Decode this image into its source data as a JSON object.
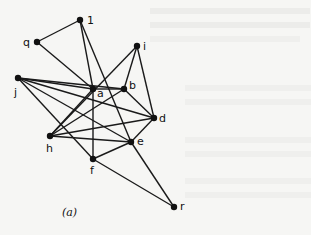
{
  "figure": {
    "caption": "(a)",
    "nodes": [
      {
        "id": "l",
        "label": "1",
        "x": 80,
        "y": 20,
        "lx": 87,
        "ly": 24
      },
      {
        "id": "q",
        "label": "q",
        "x": 37,
        "y": 42,
        "lx": 23,
        "ly": 46
      },
      {
        "id": "i",
        "label": "i",
        "x": 137,
        "y": 46,
        "lx": 143,
        "ly": 50
      },
      {
        "id": "j",
        "label": "j",
        "x": 18,
        "y": 78,
        "lx": 14,
        "ly": 96
      },
      {
        "id": "a",
        "label": "a",
        "x": 93,
        "y": 89,
        "lx": 97,
        "ly": 97
      },
      {
        "id": "b",
        "label": "b",
        "x": 124,
        "y": 89,
        "lx": 129,
        "ly": 89
      },
      {
        "id": "d",
        "label": "d",
        "x": 154,
        "y": 118,
        "lx": 159,
        "ly": 122
      },
      {
        "id": "h",
        "label": "h",
        "x": 50,
        "y": 136,
        "lx": 46,
        "ly": 152
      },
      {
        "id": "e",
        "label": "e",
        "x": 131,
        "y": 142,
        "lx": 137,
        "ly": 145
      },
      {
        "id": "f",
        "label": "f",
        "x": 93,
        "y": 159,
        "lx": 90,
        "ly": 174
      },
      {
        "id": "r",
        "label": "r",
        "x": 174,
        "y": 207,
        "lx": 180,
        "ly": 210
      }
    ],
    "edges": [
      [
        "l",
        "q"
      ],
      [
        "l",
        "a"
      ],
      [
        "l",
        "e"
      ],
      [
        "q",
        "a"
      ],
      [
        "i",
        "h"
      ],
      [
        "i",
        "b"
      ],
      [
        "i",
        "d"
      ],
      [
        "j",
        "a"
      ],
      [
        "j",
        "b"
      ],
      [
        "j",
        "d"
      ],
      [
        "j",
        "e"
      ],
      [
        "j",
        "f"
      ],
      [
        "a",
        "b"
      ],
      [
        "a",
        "f"
      ],
      [
        "a",
        "h"
      ],
      [
        "b",
        "h"
      ],
      [
        "b",
        "d"
      ],
      [
        "h",
        "d"
      ],
      [
        "h",
        "e"
      ],
      [
        "e",
        "d"
      ],
      [
        "e",
        "f"
      ],
      [
        "e",
        "r"
      ],
      [
        "f",
        "r"
      ]
    ]
  }
}
